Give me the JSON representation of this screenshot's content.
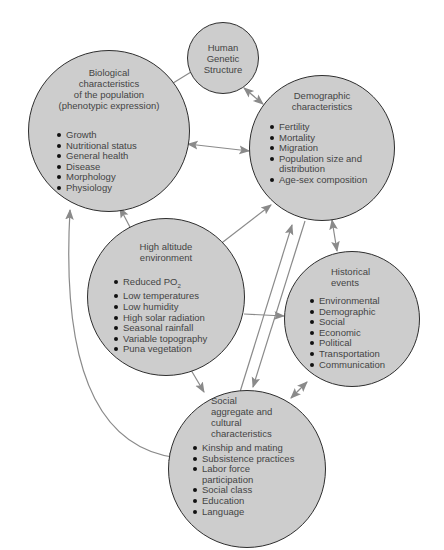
{
  "diagram": {
    "colors": {
      "node_fill": "#cdcdcd",
      "node_border": "#2e2e2e",
      "arrow": "#8a8a8a",
      "text": "#444444"
    },
    "nodes": {
      "genetic": {
        "title_lines": [
          "Human",
          "Genetic",
          "Structure"
        ],
        "items": []
      },
      "biological": {
        "title_lines": [
          "Biological",
          "characteristics",
          "of the population",
          "(phenotypic expression)"
        ],
        "items": [
          "Growth",
          "Nutritional status",
          "General health",
          "Disease",
          "Morphology",
          "Physiology"
        ]
      },
      "demographic": {
        "title_lines": [
          "Demographic",
          "characteristics"
        ],
        "items": [
          "Fertility",
          "Mortality",
          "Migration",
          "Population size and",
          "Age-sex composition"
        ],
        "item_continuation": "distribution"
      },
      "high_altitude": {
        "title_lines": [
          "High altitude",
          "environment"
        ],
        "items": [
          "Reduced PO",
          "Low temperatures",
          "Low humidity",
          "High solar radiation",
          "Seasonal rainfall",
          "Variable topography",
          "Puna vegetation"
        ],
        "subscript": "2"
      },
      "historical": {
        "title_lines": [
          "Historical",
          "events"
        ],
        "items": [
          "Environmental",
          "Demographic",
          "Social",
          "Economic",
          "Political",
          "Transportation",
          "Communication"
        ]
      },
      "social": {
        "title_lines": [
          "Social",
          "aggregate and",
          "cultural",
          "characteristics"
        ],
        "items": [
          "Kinship and mating",
          "Subsistence practices",
          "Labor force",
          "Social class",
          "Education",
          "Language"
        ],
        "item_continuation": "participation"
      }
    },
    "edges": [
      {
        "from": "genetic",
        "to": "biological",
        "direction": "to"
      },
      {
        "from": "genetic",
        "to": "demographic",
        "direction": "both"
      },
      {
        "from": "biological",
        "to": "demographic",
        "direction": "both"
      },
      {
        "from": "high_altitude",
        "to": "biological",
        "direction": "to"
      },
      {
        "from": "high_altitude",
        "to": "demographic",
        "direction": "to"
      },
      {
        "from": "high_altitude",
        "to": "historical",
        "direction": "to"
      },
      {
        "from": "high_altitude",
        "to": "social",
        "direction": "to"
      },
      {
        "from": "demographic",
        "to": "historical",
        "direction": "both"
      },
      {
        "from": "social",
        "to": "demographic",
        "direction": "to"
      },
      {
        "from": "demographic",
        "to": "social",
        "direction": "to"
      },
      {
        "from": "historical",
        "to": "social",
        "direction": "both"
      },
      {
        "from": "social",
        "to": "biological",
        "direction": "both",
        "curved": true
      }
    ]
  }
}
